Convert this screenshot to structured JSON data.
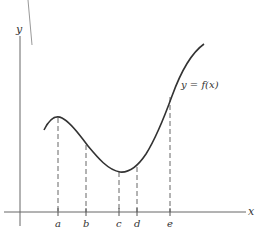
{
  "diagram": {
    "axes": {
      "x_label": "x",
      "y_label": "y"
    },
    "curve_label": "y = f(x)",
    "tick_labels": [
      "a",
      "b",
      "c",
      "d",
      "e"
    ],
    "colors": {
      "axis": "#555555",
      "curve": "#333333",
      "dashed": "#666666",
      "stray_line": "#999999"
    }
  }
}
